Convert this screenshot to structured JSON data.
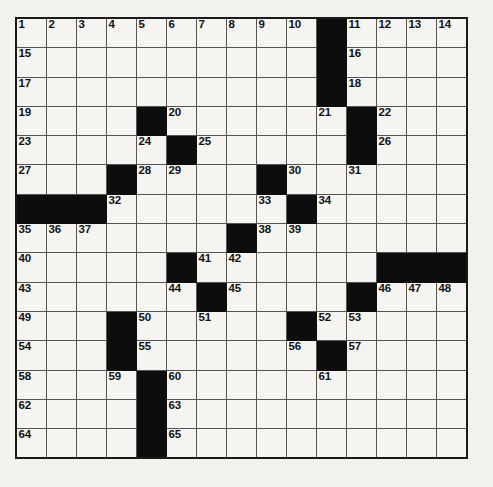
{
  "puzzle": {
    "kind": "crossword-grid",
    "rows": 15,
    "cols": 15,
    "colors": {
      "page_background": "#f3f2ef",
      "cell_background": "#f5f4f1",
      "block_color": "#0d0d0d",
      "grid_line": "#555453",
      "outer_border": "#1a1a1a",
      "number_color": "#111111"
    },
    "highest_number": 65,
    "grid": [
      [
        {
          "n": "1"
        },
        {
          "n": "2"
        },
        {
          "n": "3"
        },
        {
          "n": "4"
        },
        {
          "n": "5"
        },
        {
          "n": "6"
        },
        {
          "n": "7"
        },
        {
          "n": "8"
        },
        {
          "n": "9"
        },
        {
          "n": "10"
        },
        {
          "block": true
        },
        {
          "n": "11"
        },
        {
          "n": "12"
        },
        {
          "n": "13"
        },
        {
          "n": "14"
        }
      ],
      [
        {
          "n": "15"
        },
        {},
        {},
        {},
        {},
        {},
        {},
        {},
        {},
        {},
        {
          "block": true
        },
        {
          "n": "16"
        },
        {},
        {},
        {}
      ],
      [
        {
          "n": "17"
        },
        {},
        {},
        {},
        {},
        {},
        {},
        {},
        {},
        {},
        {
          "block": true
        },
        {
          "n": "18"
        },
        {},
        {},
        {}
      ],
      [
        {
          "n": "19"
        },
        {},
        {},
        {},
        {
          "block": true
        },
        {
          "n": "20"
        },
        {},
        {},
        {},
        {},
        {
          "n": "21"
        },
        {
          "block": true
        },
        {
          "n": "22"
        },
        {},
        {}
      ],
      [
        {
          "n": "23"
        },
        {},
        {},
        {},
        {
          "n": "24"
        },
        {
          "block": true
        },
        {
          "n": "25"
        },
        {},
        {},
        {},
        {},
        {
          "block": true
        },
        {
          "n": "26"
        },
        {},
        {}
      ],
      [
        {
          "n": "27"
        },
        {},
        {},
        {
          "block": true
        },
        {
          "n": "28"
        },
        {
          "n": "29"
        },
        {},
        {},
        {
          "block": true
        },
        {
          "n": "30"
        },
        {},
        {
          "n": "31"
        },
        {},
        {},
        {}
      ],
      [
        {
          "block": true
        },
        {
          "block": true
        },
        {
          "block": true
        },
        {
          "n": "32"
        },
        {},
        {},
        {},
        {},
        {
          "n": "33"
        },
        {
          "block": true
        },
        {
          "n": "34"
        },
        {},
        {},
        {},
        {}
      ],
      [
        {
          "n": "35"
        },
        {
          "n": "36"
        },
        {
          "n": "37"
        },
        {},
        {},
        {},
        {},
        {
          "block": true
        },
        {
          "n": "38"
        },
        {
          "n": "39"
        },
        {},
        {},
        {},
        {},
        {}
      ],
      [
        {
          "n": "40"
        },
        {},
        {},
        {},
        {},
        {
          "block": true
        },
        {
          "n": "41"
        },
        {
          "n": "42"
        },
        {},
        {},
        {},
        {},
        {
          "block": true
        },
        {
          "block": true
        },
        {
          "block": true
        }
      ],
      [
        {
          "n": "43"
        },
        {},
        {},
        {},
        {},
        {
          "n": "44"
        },
        {
          "block": true
        },
        {
          "n": "45"
        },
        {},
        {},
        {},
        {
          "block": true
        },
        {
          "n": "46"
        },
        {
          "n": "47"
        },
        {
          "n": "48"
        }
      ],
      [
        {
          "n": "49"
        },
        {},
        {},
        {
          "block": true
        },
        {
          "n": "50"
        },
        {},
        {
          "n": "51"
        },
        {},
        {},
        {
          "block": true
        },
        {
          "n": "52"
        },
        {
          "n": "53"
        },
        {},
        {},
        {}
      ],
      [
        {
          "n": "54"
        },
        {},
        {},
        {
          "block": true
        },
        {
          "n": "55"
        },
        {},
        {},
        {},
        {},
        {
          "n": "56"
        },
        {
          "block": true
        },
        {
          "n": "57"
        },
        {},
        {},
        {}
      ],
      [
        {
          "n": "58"
        },
        {},
        {},
        {
          "n": "59"
        },
        {
          "block": true
        },
        {
          "n": "60"
        },
        {},
        {},
        {},
        {},
        {
          "n": "61"
        },
        {},
        {},
        {},
        {}
      ],
      [
        {
          "n": "62"
        },
        {},
        {},
        {},
        {
          "block": true
        },
        {
          "n": "63"
        },
        {},
        {},
        {},
        {},
        {},
        {},
        {},
        {},
        {}
      ],
      [
        {
          "n": "64"
        },
        {},
        {},
        {},
        {
          "block": true
        },
        {
          "n": "65"
        },
        {},
        {},
        {},
        {},
        {},
        {},
        {},
        {},
        {}
      ]
    ]
  }
}
